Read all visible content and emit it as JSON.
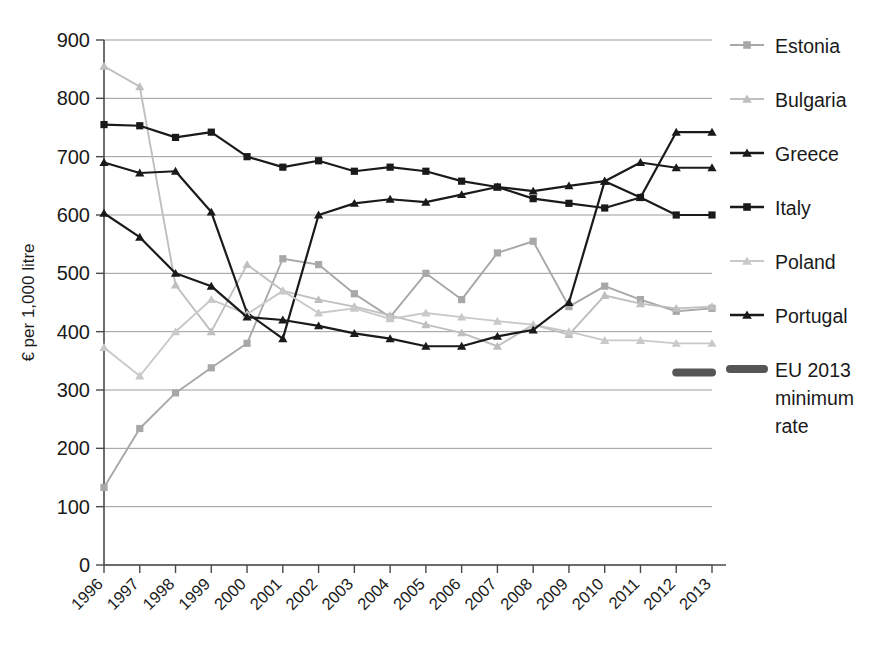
{
  "chart_data": {
    "type": "line",
    "title": "",
    "xlabel": "",
    "ylabel": "€ per 1,000 litre",
    "ylim": [
      0,
      900
    ],
    "ytick_step": 100,
    "yticks": [
      "0",
      "100",
      "200",
      "300",
      "400",
      "500",
      "600",
      "700",
      "800",
      "900"
    ],
    "grid": true,
    "legend_position": "right",
    "categories": [
      "1996",
      "1997",
      "1998",
      "1999",
      "2000",
      "2001",
      "2002",
      "2003",
      "2004",
      "2005",
      "2006",
      "2007",
      "2008",
      "2009",
      "2010",
      "2011",
      "2012",
      "2013"
    ],
    "series": [
      {
        "name": "Estonia",
        "color": "#a8a8a8",
        "marker": "square",
        "values": [
          133,
          234,
          295,
          338,
          380,
          525,
          515,
          465,
          425,
          500,
          455,
          535,
          555,
          443,
          478,
          455,
          435,
          440
        ]
      },
      {
        "name": "Bulgaria",
        "color": "#bfbfbf",
        "marker": "triangle",
        "values": [
          855,
          820,
          480,
          400,
          515,
          470,
          455,
          443,
          428,
          412,
          398,
          375,
          412,
          395,
          462,
          448,
          440,
          443
        ]
      },
      {
        "name": "Greece",
        "color": "#1a1a1a",
        "marker": "triangle",
        "values": [
          690,
          672,
          675,
          605,
          432,
          388,
          600,
          620,
          627,
          622,
          635,
          648,
          641,
          650,
          658,
          690,
          681,
          681
        ]
      },
      {
        "name": "Italy",
        "color": "#1a1a1a",
        "marker": "square",
        "values": [
          755,
          753,
          733,
          742,
          700,
          682,
          693,
          675,
          682,
          675,
          658,
          648,
          628,
          620,
          612,
          630,
          600,
          600
        ]
      },
      {
        "name": "Poland",
        "color": "#c9c9c9",
        "marker": "triangle",
        "values": [
          373,
          324,
          400,
          455,
          430,
          470,
          432,
          440,
          422,
          432,
          425,
          418,
          412,
          400,
          385,
          385,
          380,
          380
        ]
      },
      {
        "name": "Portugal",
        "color": "#1a1a1a",
        "marker": "triangle",
        "values": [
          603,
          562,
          500,
          478,
          425,
          420,
          410,
          397,
          388,
          375,
          375,
          392,
          403,
          450,
          658,
          630,
          742,
          742
        ]
      },
      {
        "name": "EU 2013 minimum rate",
        "color": "#555555",
        "marker": "bar",
        "values": [
          null,
          null,
          null,
          null,
          null,
          null,
          null,
          null,
          null,
          null,
          null,
          null,
          null,
          null,
          null,
          null,
          330,
          330
        ]
      }
    ]
  },
  "legend": {
    "items": [
      {
        "label": "Estonia"
      },
      {
        "label": "Bulgaria"
      },
      {
        "label": "Greece"
      },
      {
        "label": "Italy"
      },
      {
        "label": "Poland"
      },
      {
        "label": "Portugal"
      },
      {
        "label": "EU 2013"
      },
      {
        "label": "minimum"
      },
      {
        "label": "rate"
      }
    ]
  }
}
